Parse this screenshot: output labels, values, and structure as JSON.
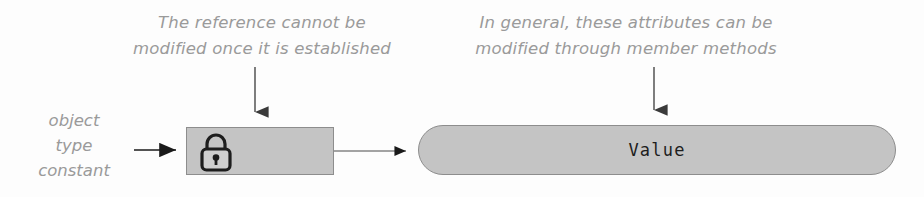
{
  "figure": {
    "type": "diagram"
  },
  "annotations": {
    "left": {
      "line1": "The reference cannot be",
      "line2": "modified once it is established"
    },
    "right": {
      "line1": "In general, these attributes can be",
      "line2": "modified through member methods"
    }
  },
  "side_label": {
    "line1": "object",
    "line2": "type",
    "line3": "constant"
  },
  "reference_box": {
    "icon": "lock-icon"
  },
  "value_pill": {
    "label": "Value"
  },
  "colors": {
    "shape_fill": "#c4c4c4",
    "shape_border": "#8d8d8d",
    "annotation_text": "#9a9a9a",
    "value_text": "#1d1d1d",
    "arrow": "#3a3a3a",
    "background": "#fdfdfd"
  }
}
